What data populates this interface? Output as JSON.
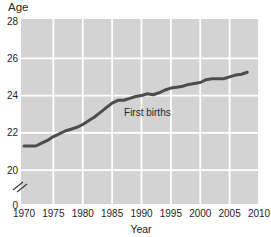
{
  "labels": {
    "y_axis_title": "Age",
    "x_axis_title": "Year"
  },
  "chart_data": {
    "type": "line",
    "title": "",
    "ylabel": "Age",
    "xlabel": "Year",
    "x_ticks": [
      1970,
      1975,
      1980,
      1985,
      1990,
      1995,
      2000,
      2005,
      2010
    ],
    "y_ticks": [
      28,
      26,
      24,
      22,
      20,
      0
    ],
    "xlim": [
      1970,
      2010
    ],
    "ylim": [
      20,
      28
    ],
    "axis_break": true,
    "grid": true,
    "legend_position": "none",
    "series": [
      {
        "name": "First births",
        "x": [
          1970,
          1971,
          1972,
          1973,
          1974,
          1975,
          1976,
          1977,
          1978,
          1979,
          1980,
          1981,
          1982,
          1983,
          1984,
          1985,
          1986,
          1987,
          1988,
          1989,
          1990,
          1991,
          1992,
          1993,
          1994,
          1995,
          1996,
          1997,
          1998,
          1999,
          2000,
          2001,
          2002,
          2003,
          2004,
          2005,
          2006,
          2007,
          2008
        ],
        "y": [
          21.3,
          21.3,
          21.3,
          21.45,
          21.6,
          21.8,
          21.95,
          22.1,
          22.2,
          22.3,
          22.45,
          22.65,
          22.85,
          23.1,
          23.35,
          23.6,
          23.75,
          23.75,
          23.85,
          23.95,
          24.0,
          24.1,
          24.05,
          24.15,
          24.3,
          24.4,
          24.45,
          24.5,
          24.6,
          24.65,
          24.7,
          24.85,
          24.9,
          24.9,
          24.9,
          25.0,
          25.1,
          25.15,
          25.25
        ]
      }
    ],
    "annotation": {
      "text": "First births",
      "anchor_year": 1991,
      "anchor_age": 23.1
    },
    "colors": {
      "plot_background": "#d3d3d3",
      "gridline": "#ffffff",
      "line": "#4d4d4d",
      "text": "#262626"
    }
  }
}
